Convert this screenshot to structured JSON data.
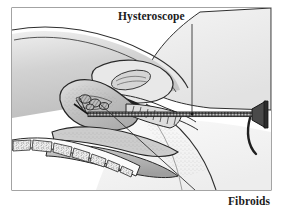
{
  "figure": {
    "kind": "medical-illustration",
    "view": "sagittal cross-section of female pelvis",
    "procedure": "hysteroscopy",
    "style": "grayscale line drawing with stipple and hatch shading",
    "frame_visible": true
  },
  "labels": {
    "hysteroscope": "Hysteroscope",
    "fibroids": "Fibroids"
  },
  "annotations": [
    {
      "id": "hysteroscope",
      "text": "Hysteroscope",
      "leader": "vertical line from label down to instrument shaft",
      "points_to": "hysteroscope shaft inside vaginal canal"
    },
    {
      "id": "fibroids",
      "text": "Fibroids",
      "leader": "horizontal stub joined to long diagonal line up-left",
      "points_to": "fibroid masses inside uterine cavity"
    }
  ],
  "structures": [
    {
      "name": "abdominal-wall",
      "note": "gray gradient band upper left"
    },
    {
      "name": "bladder",
      "note": "oval outline above uterus"
    },
    {
      "name": "uterus",
      "note": "pear-shaped organ, center left"
    },
    {
      "name": "uterine-cavity-fibroids",
      "note": "clustered dark hatched masses"
    },
    {
      "name": "cervix",
      "note": "corrugated canal right of uterus"
    },
    {
      "name": "vaginal-canal",
      "note": "elongated channel below uterus"
    },
    {
      "name": "rectum",
      "note": "shaded tube below vagina"
    },
    {
      "name": "sacrum-vertebrae",
      "note": "segmented bones lower left with trabecular texture"
    },
    {
      "name": "thigh",
      "note": "large curved shape right side"
    }
  ],
  "instrument": {
    "name": "hysteroscope",
    "parts": [
      {
        "part": "shaft",
        "note": "long thin rod entering vagina to uterus"
      },
      {
        "part": "eyepiece",
        "note": "funnel shaped viewing end at far right"
      },
      {
        "part": "light-cable",
        "note": "curved cord looping down from eyepiece"
      }
    ]
  },
  "colors": {
    "ink": "#1b1b1b",
    "stroke": "#2a2a2a",
    "fill_light": "#f2f2f2",
    "fill_mid": "#d8d8d8",
    "fill_dark": "#9a9a9a",
    "fill_darker": "#6e6e6e",
    "background": "#ffffff",
    "frame": "#555555"
  }
}
